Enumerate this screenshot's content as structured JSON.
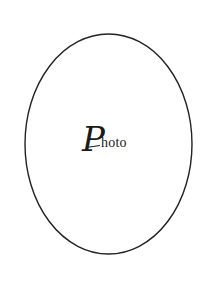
{
  "placeholder": {
    "label_initial": "P",
    "label_rest": "hoto",
    "full_label": "Photo",
    "shape": "ellipse",
    "ellipse": {
      "cx": 108.5,
      "cy": 144,
      "rx": 83.5,
      "ry": 110
    },
    "stroke_color": "#222222",
    "background_color": "#ffffff"
  }
}
